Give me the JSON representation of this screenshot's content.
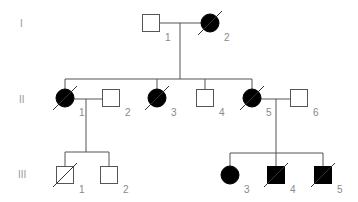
{
  "diagram": {
    "type": "pedigree",
    "generations": [
      {
        "label": "I",
        "individuals": [
          {
            "id": "I-1",
            "number": "1",
            "sex": "male",
            "affected": false,
            "deceased": false
          },
          {
            "id": "I-2",
            "number": "2",
            "sex": "female",
            "affected": true,
            "deceased": true
          }
        ]
      },
      {
        "label": "II",
        "individuals": [
          {
            "id": "II-1",
            "number": "1",
            "sex": "female",
            "affected": true,
            "deceased": true
          },
          {
            "id": "II-2",
            "number": "2",
            "sex": "male",
            "affected": false,
            "deceased": false
          },
          {
            "id": "II-3",
            "number": "3",
            "sex": "female",
            "affected": true,
            "deceased": true
          },
          {
            "id": "II-4",
            "number": "4",
            "sex": "male",
            "affected": false,
            "deceased": false
          },
          {
            "id": "II-5",
            "number": "5",
            "sex": "female",
            "affected": true,
            "deceased": true
          },
          {
            "id": "II-6",
            "number": "6",
            "sex": "male",
            "affected": false,
            "deceased": false
          }
        ]
      },
      {
        "label": "III",
        "individuals": [
          {
            "id": "III-1",
            "number": "1",
            "sex": "male",
            "affected": false,
            "deceased": true
          },
          {
            "id": "III-2",
            "number": "2",
            "sex": "male",
            "affected": false,
            "deceased": false
          },
          {
            "id": "III-3",
            "number": "3",
            "sex": "female",
            "affected": true,
            "deceased": false
          },
          {
            "id": "III-4",
            "number": "4",
            "sex": "male",
            "affected": true,
            "deceased": true
          },
          {
            "id": "III-5",
            "number": "5",
            "sex": "male",
            "affected": true,
            "deceased": true
          }
        ]
      }
    ],
    "matings": [
      {
        "partners": [
          "I-1",
          "I-2"
        ],
        "children": [
          "II-1",
          "II-3",
          "II-4",
          "II-5"
        ]
      },
      {
        "partners": [
          "II-1",
          "II-2"
        ],
        "children": [
          "III-1",
          "III-2"
        ]
      },
      {
        "partners": [
          "II-5",
          "II-6"
        ],
        "children": [
          "III-3",
          "III-4",
          "III-5"
        ]
      }
    ],
    "colors": {
      "affected": "#000000",
      "unaffected": "#ffffff",
      "line": "#555555",
      "label": "#888888"
    }
  }
}
